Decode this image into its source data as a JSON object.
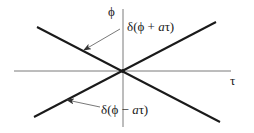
{
  "diagram": {
    "type": "characteristic-lines",
    "axes": {
      "vertical_label": "ϕ",
      "horizontal_label": "τ"
    },
    "lines": [
      {
        "name": "delta-phi-plus-a-tau",
        "label_prefix": "δ(ϕ + ",
        "label_italic": "a",
        "label_suffix": "τ)",
        "slope": "negative"
      },
      {
        "name": "delta-phi-minus-a-tau",
        "label_prefix": "δ(ϕ − ",
        "label_italic": "a",
        "label_suffix": "τ)",
        "slope": "positive"
      }
    ],
    "colors": {
      "line": "#1a1a1a",
      "axis": "#6e6e6e",
      "arrow": "#555555",
      "background": "#ffffff"
    }
  }
}
